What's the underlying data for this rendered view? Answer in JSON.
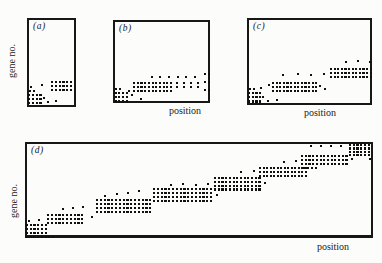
{
  "figure": {
    "kind": "scanned journal figure, four dot-matrix scatter panels",
    "background": "#fcfcfa",
    "ink": "#101010",
    "x_axis_label": "position",
    "y_axis_label": "gene no."
  },
  "panels": [
    {
      "key": "a",
      "label": "(a)",
      "has_y_label": true,
      "has_x_label": false
    },
    {
      "key": "b",
      "label": "(b)",
      "has_y_label": false,
      "has_x_label": true
    },
    {
      "key": "c",
      "label": "(c)",
      "has_y_label": false,
      "has_x_label": true
    },
    {
      "key": "d",
      "label": "(d)",
      "has_y_label": true,
      "has_x_label": true
    }
  ],
  "chart_data": [
    {
      "type": "scatter",
      "panel_label": "(a)",
      "xlabel": "",
      "ylabel": "gene no.",
      "axes": "no ticks or numeric scale; qualitative dot raster, origin bottom-left",
      "units": "px from panel top-left corner",
      "clusters": [
        {
          "x": 1,
          "y": 76,
          "cols": 4,
          "rows": 3,
          "dx": 3.8,
          "dy": 4
        },
        {
          "x": 24,
          "y": 63,
          "cols": 6,
          "rows": 3,
          "dx": 3.8,
          "dy": 4
        }
      ],
      "points": [
        [
          2,
          72
        ],
        [
          6,
          72
        ],
        [
          3,
          68
        ],
        [
          14,
          66
        ],
        [
          16,
          79
        ],
        [
          20,
          83
        ],
        [
          28,
          82
        ]
      ]
    },
    {
      "type": "scatter",
      "panel_label": "(b)",
      "xlabel": "position",
      "ylabel": "",
      "axes": "no ticks or numeric scale; qualitative dot raster, origin bottom-left",
      "units": "px from panel top-left corner",
      "clusters": [
        {
          "x": 1.5,
          "y": 72,
          "cols": 4,
          "rows": 3,
          "dx": 3.7,
          "dy": 4.2
        },
        {
          "x": 20,
          "y": 62,
          "cols": 11,
          "rows": 3,
          "dx": 3.7,
          "dy": 4
        }
      ],
      "points": [
        [
          2,
          68
        ],
        [
          6,
          68
        ],
        [
          15,
          70
        ],
        [
          18,
          74
        ],
        [
          27,
          78
        ],
        [
          63,
          62
        ],
        [
          70,
          62
        ],
        [
          77,
          62
        ],
        [
          84,
          62
        ],
        [
          63,
          66
        ],
        [
          70,
          66
        ],
        [
          77,
          66
        ],
        [
          84,
          66
        ],
        [
          91,
          53
        ],
        [
          95,
          53
        ],
        [
          91,
          61
        ],
        [
          95,
          61
        ],
        [
          91,
          69
        ],
        [
          95,
          69
        ],
        [
          38,
          56
        ],
        [
          46,
          55.5
        ],
        [
          55,
          56
        ],
        [
          64,
          55.5
        ],
        [
          72,
          56
        ],
        [
          81,
          55.5
        ]
      ]
    },
    {
      "type": "scatter",
      "panel_label": "(c)",
      "xlabel": "position",
      "ylabel": "",
      "axes": "no ticks or numeric scale; qualitative dot raster, origin bottom-left",
      "units": "px from panel top-left corner",
      "clusters": [
        {
          "x": 1,
          "y": 74,
          "cols": 4,
          "rows": 3,
          "dx": 3.7,
          "dy": 4.2
        },
        {
          "x": 25,
          "y": 64,
          "cols": 13,
          "rows": 3,
          "dx": 3.6,
          "dy": 4
        },
        {
          "x": 83,
          "y": 50,
          "cols": 12,
          "rows": 3,
          "dx": 3.6,
          "dy": 4
        }
      ],
      "points": [
        [
          2,
          70
        ],
        [
          6,
          70
        ],
        [
          13,
          69
        ],
        [
          21,
          66
        ],
        [
          15,
          78
        ],
        [
          20,
          82
        ],
        [
          29,
          81
        ],
        [
          72,
          67
        ],
        [
          77,
          70
        ],
        [
          35,
          56
        ],
        [
          50,
          55
        ],
        [
          63,
          56
        ],
        [
          76,
          55
        ],
        [
          98,
          43
        ],
        [
          110,
          42
        ],
        [
          122,
          43
        ]
      ]
    },
    {
      "type": "scatter",
      "panel_label": "(d)",
      "xlabel": "position",
      "ylabel": "gene no.",
      "axes": "no ticks or numeric scale; staircase of dense dot blocks rising left-to-right",
      "units": "px from panel top-left corner",
      "clusters": [
        {
          "x": 1,
          "y": 82,
          "cols": 6,
          "rows": 3,
          "dx": 3.7,
          "dy": 4
        },
        {
          "x": 1,
          "y": 94,
          "cols": 8,
          "rows": 1,
          "dx": 3.7,
          "dy": 4
        },
        {
          "x": 22,
          "y": 72,
          "cols": 10,
          "rows": 3,
          "dx": 3.8,
          "dy": 4
        },
        {
          "x": 71,
          "y": 57,
          "cols": 15,
          "rows": 4,
          "dx": 3.8,
          "dy": 4
        },
        {
          "x": 128,
          "y": 46,
          "cols": 16,
          "rows": 4,
          "dx": 3.8,
          "dy": 4
        },
        {
          "x": 189,
          "y": 35,
          "cols": 13,
          "rows": 4,
          "dx": 3.7,
          "dy": 3.8
        },
        {
          "x": 234,
          "y": 25,
          "cols": 14,
          "rows": 3,
          "dx": 3.5,
          "dy": 3.8
        },
        {
          "x": 276,
          "y": 13,
          "cols": 13,
          "rows": 3,
          "dx": 3.7,
          "dy": 3.8
        },
        {
          "x": 324,
          "y": 2,
          "cols": 6,
          "rows": 4,
          "dx": 3.7,
          "dy": 3.4
        }
      ],
      "points": [
        [
          3,
          78
        ],
        [
          13,
          77
        ],
        [
          37,
          66
        ],
        [
          47,
          65
        ],
        [
          57,
          64
        ],
        [
          66,
          74
        ],
        [
          79,
          53
        ],
        [
          91,
          51
        ],
        [
          102,
          50
        ],
        [
          113,
          48
        ],
        [
          145,
          42
        ],
        [
          157,
          41
        ],
        [
          170,
          42
        ],
        [
          182,
          41
        ],
        [
          191,
          52
        ],
        [
          215,
          29
        ],
        [
          228,
          28
        ],
        [
          239,
          40
        ],
        [
          258,
          19
        ],
        [
          270,
          18
        ],
        [
          278,
          24.5
        ],
        [
          282,
          24.5
        ],
        [
          286,
          24.5
        ],
        [
          290,
          24.5
        ],
        [
          326,
          16
        ],
        [
          344,
          16
        ],
        [
          285,
          3
        ],
        [
          295,
          2.5
        ],
        [
          305,
          3
        ],
        [
          315,
          2.5
        ]
      ]
    }
  ]
}
